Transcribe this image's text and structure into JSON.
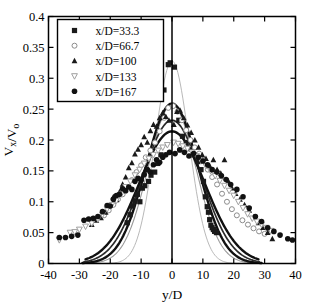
{
  "figure": {
    "cropped_caption_fragment": "",
    "background_color": "#ffffff",
    "frame_color": "#000000"
  },
  "axes": {
    "x_label": "y/D",
    "y_label": "Vx/Vo",
    "y_label_parts": {
      "v": "V",
      "sub_x": "x",
      "slash": "/",
      "v2": "V",
      "sub_o": "o"
    },
    "x_ticks": [
      "-40",
      "-30",
      "-20",
      "-10",
      "0",
      "10",
      "20",
      "30",
      "40"
    ],
    "y_ticks": [
      "0",
      "0.05",
      "0.1",
      "0.15",
      "0.2",
      "0.25",
      "0.3",
      "0.35",
      "0.4"
    ],
    "xlim": [
      -40,
      40
    ],
    "ylim": [
      0,
      0.4
    ],
    "grid": false,
    "centerline_at_x": 0
  },
  "legend": {
    "position": "top-left",
    "border_color": "#000000",
    "items": [
      {
        "label": "x/D=33.3",
        "marker": "filled-square",
        "color": "#1a1a1a",
        "series_key": "xD_33_3"
      },
      {
        "label": "x/D=66.7",
        "marker": "open-circle",
        "color": "#8c8c8c",
        "series_key": "xD_66_7"
      },
      {
        "label": "x/D=100",
        "marker": "filled-triangle-up",
        "color": "#1a1a1a",
        "series_key": "xD_100"
      },
      {
        "label": "x/D=133",
        "marker": "open-triangle-down",
        "color": "#a0a0a0",
        "series_key": "xD_133"
      },
      {
        "label": "x/D=167",
        "marker": "filled-circle",
        "color": "#111111",
        "series_key": "xD_167"
      }
    ]
  },
  "chart_data": {
    "type": "scatter",
    "title": "",
    "xlabel": "y/D",
    "ylabel": "Vx/Vo",
    "xlim": [
      -40,
      40
    ],
    "ylim": [
      0,
      0.4
    ],
    "grid": false,
    "legend_position": "top-left",
    "series": [
      {
        "name": "x/D=33.3",
        "marker": "filled-square",
        "color": "#1a1a1a",
        "points": [
          [
            -14.5,
            0.066
          ],
          [
            -13.6,
            0.079
          ],
          [
            -12.8,
            0.093
          ],
          [
            -12.0,
            0.101
          ],
          [
            -11.2,
            0.112
          ],
          [
            -10.4,
            0.1
          ],
          [
            -9.6,
            0.122
          ],
          [
            -8.8,
            0.126
          ],
          [
            -7.6,
            0.133
          ],
          [
            -6.8,
            0.143
          ],
          [
            -5.6,
            0.148
          ],
          [
            -4.6,
            0.162
          ],
          [
            -3.6,
            0.176
          ],
          [
            -2.6,
            0.281
          ],
          [
            -1.2,
            0.322
          ],
          [
            -0.6,
            0.325
          ],
          [
            0.8,
            0.318
          ],
          [
            2.2,
            0.232
          ],
          [
            3.4,
            0.206
          ],
          [
            4.6,
            0.196
          ],
          [
            6.0,
            0.186
          ],
          [
            7.2,
            0.176
          ],
          [
            8.4,
            0.165
          ],
          [
            9.4,
            0.152
          ],
          [
            10.2,
            0.133
          ],
          [
            10.8,
            0.108
          ],
          [
            11.4,
            0.092
          ],
          [
            11.8,
            0.083
          ],
          [
            12.2,
            0.071
          ],
          [
            12.6,
            0.062
          ],
          [
            13.0,
            0.058
          ],
          [
            13.4,
            0.055
          ],
          [
            13.8,
            0.052
          ],
          [
            14.4,
            0.05
          ]
        ]
      },
      {
        "name": "x/D=66.7",
        "marker": "open-circle",
        "color": "#8c8c8c",
        "points": [
          [
            -22.0,
            0.078
          ],
          [
            -20.5,
            0.086
          ],
          [
            -19.0,
            0.095
          ],
          [
            -17.5,
            0.104
          ],
          [
            -16.0,
            0.112
          ],
          [
            -14.5,
            0.124
          ],
          [
            -13.0,
            0.135
          ],
          [
            -11.5,
            0.148
          ],
          [
            -10.0,
            0.159
          ],
          [
            -8.5,
            0.172
          ],
          [
            -7.0,
            0.183
          ],
          [
            -5.5,
            0.196
          ],
          [
            -4.0,
            0.214
          ],
          [
            -2.5,
            0.236
          ],
          [
            -1.2,
            0.252
          ],
          [
            0.4,
            0.255
          ],
          [
            1.8,
            0.246
          ],
          [
            3.2,
            0.232
          ],
          [
            4.6,
            0.216
          ],
          [
            6.0,
            0.2
          ],
          [
            7.4,
            0.188
          ],
          [
            8.8,
            0.178
          ],
          [
            10.2,
            0.168
          ],
          [
            11.6,
            0.152
          ],
          [
            13.0,
            0.14
          ],
          [
            14.6,
            0.128
          ],
          [
            16.2,
            0.113
          ],
          [
            17.8,
            0.1
          ],
          [
            19.4,
            0.088
          ],
          [
            21.0,
            0.078
          ],
          [
            22.8,
            0.07
          ],
          [
            24.6,
            0.063
          ],
          [
            26.4,
            0.057
          ],
          [
            28.2,
            0.052
          ],
          [
            30.0,
            0.048
          ]
        ]
      },
      {
        "name": "x/D=100",
        "marker": "filled-triangle-up",
        "color": "#1a1a1a",
        "points": [
          [
            -26.0,
            0.063
          ],
          [
            -24.5,
            0.07
          ],
          [
            -23.0,
            0.074
          ],
          [
            -21.5,
            0.083
          ],
          [
            -20.0,
            0.095
          ],
          [
            -19.0,
            0.108
          ],
          [
            -18.0,
            0.103
          ],
          [
            -17.0,
            0.116
          ],
          [
            -16.0,
            0.128
          ],
          [
            -15.0,
            0.14
          ],
          [
            -14.0,
            0.155
          ],
          [
            -13.0,
            0.163
          ],
          [
            -12.0,
            0.177
          ],
          [
            -11.0,
            0.185
          ],
          [
            -10.0,
            0.192
          ],
          [
            -9.0,
            0.205
          ],
          [
            -8.0,
            0.196
          ],
          [
            -7.0,
            0.215
          ],
          [
            -6.0,
            0.225
          ],
          [
            -5.0,
            0.222
          ],
          [
            -4.0,
            0.236
          ],
          [
            -3.0,
            0.244
          ],
          [
            -2.0,
            0.238
          ],
          [
            -1.0,
            0.232
          ],
          [
            0.6,
            0.225
          ],
          [
            1.6,
            0.246
          ],
          [
            2.6,
            0.248
          ],
          [
            3.8,
            0.236
          ],
          [
            5.0,
            0.224
          ],
          [
            6.2,
            0.212
          ],
          [
            7.4,
            0.2
          ],
          [
            8.6,
            0.188
          ],
          [
            9.8,
            0.176
          ],
          [
            11.0,
            0.17
          ],
          [
            12.2,
            0.158
          ],
          [
            13.4,
            0.168
          ],
          [
            14.6,
            0.152
          ],
          [
            15.8,
            0.146
          ],
          [
            17.0,
            0.168
          ],
          [
            18.2,
            0.134
          ],
          [
            19.4,
            0.122
          ],
          [
            20.6,
            0.113
          ],
          [
            22.0,
            0.104
          ],
          [
            23.5,
            0.095
          ],
          [
            25.0,
            0.086
          ],
          [
            26.5,
            0.075
          ],
          [
            28.0,
            0.066
          ],
          [
            29.5,
            0.058
          ],
          [
            31.0,
            0.05
          ],
          [
            32.5,
            0.04
          ]
        ]
      },
      {
        "name": "x/D=133",
        "marker": "open-triangle-down",
        "color": "#a0a0a0",
        "points": [
          [
            -36.5,
            0.038
          ],
          [
            -33.0,
            0.05
          ],
          [
            -31.5,
            0.051
          ],
          [
            -30.0,
            0.055
          ],
          [
            -28.0,
            0.06
          ],
          [
            -26.0,
            0.065
          ],
          [
            -24.0,
            0.072
          ],
          [
            -22.5,
            0.079
          ],
          [
            -21.0,
            0.088
          ],
          [
            -19.5,
            0.095
          ],
          [
            -18.0,
            0.102
          ],
          [
            -16.5,
            0.112
          ],
          [
            -15.0,
            0.124
          ],
          [
            -13.5,
            0.133
          ],
          [
            -12.0,
            0.143
          ],
          [
            -10.5,
            0.152
          ],
          [
            -9.0,
            0.162
          ],
          [
            -7.5,
            0.17
          ],
          [
            -6.0,
            0.176
          ],
          [
            -4.5,
            0.183
          ],
          [
            -3.0,
            0.188
          ],
          [
            -1.5,
            0.192
          ],
          [
            0.5,
            0.196
          ],
          [
            2.0,
            0.194
          ],
          [
            3.5,
            0.19
          ],
          [
            5.0,
            0.186
          ],
          [
            6.5,
            0.18
          ],
          [
            8.0,
            0.174
          ],
          [
            9.5,
            0.166
          ],
          [
            11.0,
            0.158
          ],
          [
            12.5,
            0.15
          ],
          [
            14.0,
            0.142
          ],
          [
            15.5,
            0.134
          ],
          [
            17.0,
            0.126
          ],
          [
            18.5,
            0.118
          ],
          [
            20.0,
            0.11
          ],
          [
            21.5,
            0.1
          ],
          [
            23.0,
            0.09
          ],
          [
            24.5,
            0.08
          ],
          [
            26.0,
            0.073
          ],
          [
            27.5,
            0.068
          ],
          [
            29.0,
            0.063
          ],
          [
            30.5,
            0.058
          ],
          [
            32.0,
            0.053
          ]
        ]
      },
      {
        "name": "x/D=167",
        "marker": "filled-circle",
        "color": "#111111",
        "points": [
          [
            -36.5,
            0.042
          ],
          [
            -34.5,
            0.042
          ],
          [
            -32.5,
            0.044
          ],
          [
            -30.5,
            0.046
          ],
          [
            -28.5,
            0.07
          ],
          [
            -27.0,
            0.072
          ],
          [
            -25.5,
            0.073
          ],
          [
            -24.0,
            0.076
          ],
          [
            -22.5,
            0.084
          ],
          [
            -21.0,
            0.094
          ],
          [
            -20.0,
            0.093
          ],
          [
            -19.0,
            0.104
          ],
          [
            -18.0,
            0.11
          ],
          [
            -17.0,
            0.112
          ],
          [
            -16.0,
            0.121
          ],
          [
            -15.0,
            0.118
          ],
          [
            -14.0,
            0.124
          ],
          [
            -13.0,
            0.12
          ],
          [
            -12.0,
            0.133
          ],
          [
            -11.0,
            0.138
          ],
          [
            -10.0,
            0.135
          ],
          [
            -9.0,
            0.144
          ],
          [
            -8.0,
            0.152
          ],
          [
            -7.0,
            0.148
          ],
          [
            -6.0,
            0.16
          ],
          [
            -5.0,
            0.168
          ],
          [
            -4.0,
            0.164
          ],
          [
            -3.0,
            0.172
          ],
          [
            -2.0,
            0.176
          ],
          [
            -0.8,
            0.18
          ],
          [
            1.0,
            0.178
          ],
          [
            2.5,
            0.184
          ],
          [
            4.0,
            0.18
          ],
          [
            5.5,
            0.174
          ],
          [
            7.0,
            0.178
          ],
          [
            8.5,
            0.172
          ],
          [
            10.0,
            0.166
          ],
          [
            11.5,
            0.16
          ],
          [
            13.0,
            0.152
          ],
          [
            14.5,
            0.148
          ],
          [
            16.0,
            0.142
          ],
          [
            17.5,
            0.136
          ],
          [
            19.0,
            0.128
          ],
          [
            21.0,
            0.12
          ],
          [
            23.0,
            0.108
          ],
          [
            25.0,
            0.09
          ],
          [
            27.0,
            0.076
          ],
          [
            29.0,
            0.068
          ],
          [
            31.0,
            0.058
          ],
          [
            33.0,
            0.052
          ],
          [
            35.0,
            0.046
          ],
          [
            37.5,
            0.04
          ],
          [
            39.0,
            0.038
          ]
        ]
      }
    ],
    "fitted_curves": [
      {
        "name": "fit x/D=33.3",
        "style": "thin-light",
        "color": "#b0b0b0",
        "width": 0.9,
        "peak": 0.328,
        "half_width": 7.5,
        "x_start": -30.5,
        "x_end": 30.5
      },
      {
        "name": "fit x/D=66.7",
        "style": "thin-light",
        "color": "#9a9a9a",
        "width": 1.1,
        "peak": 0.257,
        "half_width": 10.5,
        "x_start": -29.5,
        "x_end": 29.5
      },
      {
        "name": "fit x/D=100",
        "style": "bold-dark",
        "color": "#111111",
        "width": 2.4,
        "peak": 0.259,
        "half_width": 11.5,
        "x_start": -29.0,
        "x_end": 29.0
      },
      {
        "name": "fit x/D=133",
        "style": "medium-dark",
        "color": "#2a2a2a",
        "width": 1.7,
        "peak": 0.232,
        "half_width": 13.0,
        "x_start": -28.5,
        "x_end": 28.5
      },
      {
        "name": "fit x/D=167",
        "style": "bold-dark",
        "color": "#111111",
        "width": 2.4,
        "peak": 0.214,
        "half_width": 14.5,
        "x_start": -28.0,
        "x_end": 28.0
      }
    ]
  }
}
